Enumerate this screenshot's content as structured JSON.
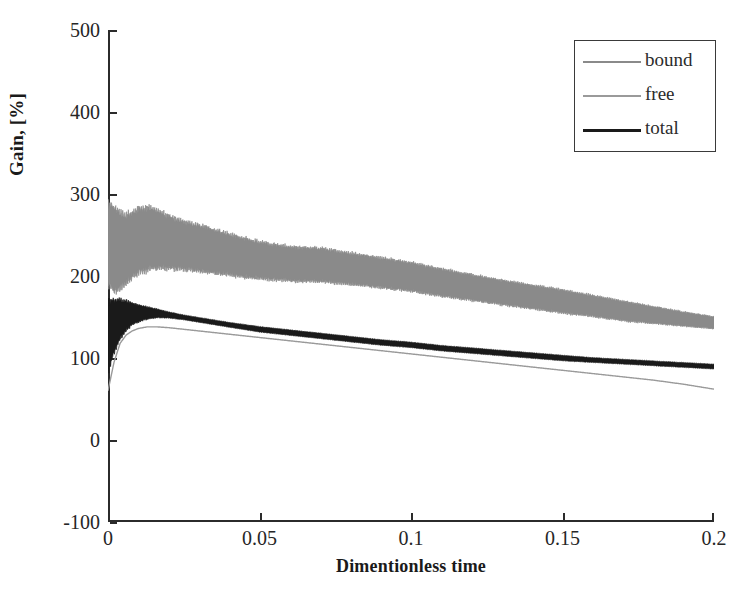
{
  "chart_data": {
    "type": "area",
    "title": "",
    "xlabel": "Dimentionless time",
    "ylabel": "Gain, [%]",
    "xlim": [
      0,
      0.2
    ],
    "ylim": [
      -100,
      500
    ],
    "xticks": [
      "0",
      "0.05",
      "0.1",
      "0.15",
      "0.2"
    ],
    "xtick_values": [
      0,
      0.05,
      0.1,
      0.15,
      0.2
    ],
    "yticks": [
      "500",
      "400",
      "300",
      "200",
      "100",
      "0",
      "-100"
    ],
    "ytick_values": [
      500,
      400,
      300,
      200,
      100,
      0,
      -100
    ],
    "grid": false,
    "legend_position": "top-right",
    "legend": [
      "bound",
      "free",
      "total"
    ],
    "colors": {
      "bound": "#8a8a8a",
      "free": "#9a9a9a",
      "total": "#1a1a1a",
      "axis": "#2b2b2b",
      "background": "#ffffff",
      "legend_border": "#3a3a3a"
    },
    "series": [
      {
        "name": "bound",
        "note": "oscillating band; envelope decays from ~300% at t=0 toward ~140% at t=0.2",
        "x": [
          0.0,
          0.002,
          0.004,
          0.006,
          0.008,
          0.01,
          0.013,
          0.016,
          0.02,
          0.025,
          0.03,
          0.035,
          0.04,
          0.05,
          0.06,
          0.07,
          0.08,
          0.09,
          0.1,
          0.11,
          0.12,
          0.13,
          0.14,
          0.15,
          0.16,
          0.17,
          0.18,
          0.19,
          0.2
        ],
        "upper": [
          300,
          295,
          288,
          282,
          286,
          290,
          292,
          288,
          280,
          272,
          268,
          262,
          256,
          246,
          240,
          238,
          232,
          226,
          220,
          212,
          205,
          198,
          192,
          186,
          179,
          172,
          165,
          158,
          152
        ],
        "lower": [
          180,
          170,
          175,
          182,
          190,
          196,
          200,
          202,
          203,
          202,
          200,
          198,
          196,
          192,
          190,
          189,
          186,
          182,
          178,
          172,
          167,
          162,
          157,
          152,
          148,
          143,
          140,
          137,
          134
        ],
        "center": [
          240,
          233,
          232,
          232,
          238,
          243,
          246,
          245,
          242,
          237,
          234,
          230,
          226,
          219,
          215,
          214,
          209,
          204,
          199,
          192,
          186,
          180,
          175,
          169,
          164,
          158,
          153,
          148,
          143
        ]
      },
      {
        "name": "free",
        "note": "thin single line rising from ~60% then decaying to ~62%",
        "x": [
          0.0,
          0.002,
          0.004,
          0.006,
          0.008,
          0.01,
          0.013,
          0.016,
          0.02,
          0.025,
          0.03,
          0.035,
          0.04,
          0.05,
          0.06,
          0.07,
          0.08,
          0.09,
          0.1,
          0.11,
          0.12,
          0.13,
          0.14,
          0.15,
          0.16,
          0.17,
          0.18,
          0.19,
          0.2
        ],
        "values": [
          60,
          95,
          118,
          128,
          133,
          136,
          138,
          138,
          137,
          135,
          133,
          131,
          129,
          125,
          121,
          117,
          113,
          109,
          105,
          101,
          97,
          93,
          89,
          85,
          81,
          77,
          73,
          68,
          62
        ]
      },
      {
        "name": "total",
        "note": "oscillating band; envelope decays from ~180% at t=0 toward ~90% at t=0.2",
        "x": [
          0.0,
          0.002,
          0.004,
          0.006,
          0.008,
          0.01,
          0.013,
          0.016,
          0.02,
          0.025,
          0.03,
          0.035,
          0.04,
          0.05,
          0.06,
          0.07,
          0.08,
          0.09,
          0.1,
          0.11,
          0.12,
          0.13,
          0.14,
          0.15,
          0.16,
          0.17,
          0.18,
          0.19,
          0.2
        ],
        "upper": [
          180,
          178,
          176,
          173,
          170,
          167,
          164,
          161,
          157,
          153,
          150,
          147,
          144,
          139,
          135,
          131,
          127,
          123,
          120,
          116,
          113,
          110,
          107,
          104,
          101,
          99,
          97,
          95,
          93
        ],
        "lower": [
          75,
          100,
          118,
          130,
          138,
          142,
          146,
          148,
          148,
          146,
          143,
          140,
          137,
          131,
          127,
          123,
          119,
          115,
          112,
          108,
          105,
          102,
          99,
          96,
          94,
          92,
          90,
          88,
          86
        ],
        "center": [
          128,
          139,
          147,
          152,
          154,
          155,
          155,
          155,
          153,
          150,
          147,
          144,
          141,
          135,
          131,
          127,
          123,
          119,
          116,
          112,
          109,
          106,
          103,
          100,
          98,
          96,
          94,
          92,
          90
        ]
      }
    ]
  }
}
